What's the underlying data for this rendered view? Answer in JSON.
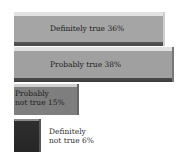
{
  "chart_data": {
    "type": "bar",
    "orientation": "horizontal",
    "title": "",
    "xlabel": "",
    "ylabel": "",
    "categories": [
      "Definitely true",
      "Probably true",
      "Probably not true",
      "Definitely not true"
    ],
    "values": [
      36,
      38,
      15,
      6
    ],
    "unit": "%",
    "grid": false,
    "legend": null,
    "colors": [
      "#a5a5a5",
      "#a0a0a0",
      "#7e7e7e",
      "#2e2e2e"
    ]
  },
  "labels": {
    "bar0": "Definitely true 36%",
    "bar1": "Probably true 38%",
    "bar2_line1": "Probably",
    "bar2_line2": "not true 15%",
    "bar3_line1": "Definitely",
    "bar3_line2": "not true 6%"
  }
}
